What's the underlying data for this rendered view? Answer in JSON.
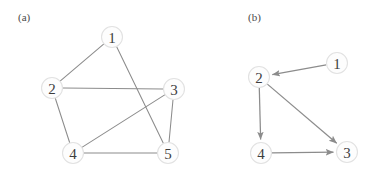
{
  "figure": {
    "background_color": "#ffffff",
    "node_fill": "#fdfdfd",
    "node_stroke": "#e2e2e2",
    "edge_color": "#8c8c8c",
    "label_color": "#3d3d3d",
    "panels": [
      {
        "key": "a",
        "caption": "(a)",
        "caption_x": 18,
        "caption_y": 21,
        "graph_type": "undirected",
        "node_radius": 10.5,
        "nodes": [
          {
            "id": "1",
            "label": "1",
            "x": 112,
            "y": 37
          },
          {
            "id": "2",
            "label": "2",
            "x": 52,
            "y": 88
          },
          {
            "id": "3",
            "label": "3",
            "x": 174,
            "y": 89
          },
          {
            "id": "4",
            "label": "4",
            "x": 73,
            "y": 153
          },
          {
            "id": "5",
            "label": "5",
            "x": 168,
            "y": 153
          }
        ],
        "edges": [
          {
            "from": "1",
            "to": "2"
          },
          {
            "from": "1",
            "to": "5"
          },
          {
            "from": "2",
            "to": "3"
          },
          {
            "from": "2",
            "to": "4"
          },
          {
            "from": "3",
            "to": "4"
          },
          {
            "from": "3",
            "to": "5"
          },
          {
            "from": "4",
            "to": "5"
          }
        ]
      },
      {
        "key": "b",
        "caption": "(b)",
        "caption_x": 248,
        "caption_y": 21,
        "graph_type": "directed",
        "node_radius": 10.5,
        "nodes": [
          {
            "id": "1",
            "label": "1",
            "x": 337,
            "y": 63
          },
          {
            "id": "2",
            "label": "2",
            "x": 259,
            "y": 77
          },
          {
            "id": "3",
            "label": "3",
            "x": 347,
            "y": 152
          },
          {
            "id": "4",
            "label": "4",
            "x": 261,
            "y": 153
          }
        ],
        "edges": [
          {
            "from": "1",
            "to": "2"
          },
          {
            "from": "2",
            "to": "4"
          },
          {
            "from": "2",
            "to": "3"
          },
          {
            "from": "4",
            "to": "3"
          }
        ]
      }
    ]
  }
}
